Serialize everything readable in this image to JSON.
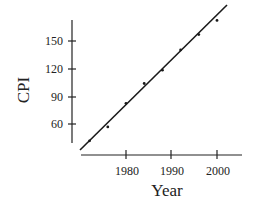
{
  "chart_data": {
    "type": "scatter",
    "title": "",
    "xlabel": "Year",
    "ylabel": "CPI",
    "x_ticks": [
      1980,
      1990,
      2000
    ],
    "y_ticks": [
      60,
      90,
      120,
      150
    ],
    "xlim": [
      1970,
      2006
    ],
    "ylim": [
      32,
      180
    ],
    "grid": false,
    "legend": null,
    "series": [
      {
        "name": "CPI",
        "x": [
          1972,
          1976,
          1980,
          1984,
          1988,
          1992,
          1996,
          2000
        ],
        "y": [
          41.8,
          56.9,
          82.4,
          103.9,
          118.3,
          140.3,
          156.9,
          172.2
        ]
      }
    ],
    "fit_line": {
      "type": "linear regression",
      "x": [
        1970.5,
        2002.8
      ],
      "y": [
        32.0,
        189.0
      ]
    }
  },
  "labels": {
    "x_axis_title": "Year",
    "y_axis_title": "CPI",
    "x_tick_1980": "1980",
    "x_tick_1990": "1990",
    "x_tick_2000": "2000",
    "y_tick_60": "60",
    "y_tick_90": "90",
    "y_tick_120": "120",
    "y_tick_150": "150"
  }
}
